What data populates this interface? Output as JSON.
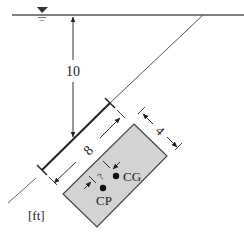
{
  "diagram": {
    "type": "hydrostatic-inclined-plate",
    "units_label": "[ft]",
    "depth_label": "10",
    "length_label": "8",
    "width_label": "4",
    "offset_label": "?",
    "cg_label": "CG",
    "cp_label": "CP",
    "colors": {
      "line": "#333333",
      "plate_fill": "#d3d3d3",
      "plate_stroke": "#444444",
      "background": "#ffffff"
    }
  }
}
